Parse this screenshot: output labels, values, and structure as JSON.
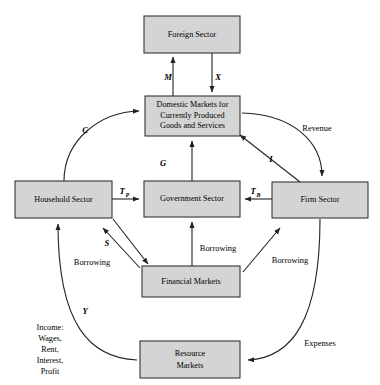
{
  "diagram": {
    "boxes": [
      {
        "id": "foreign",
        "label_lines": [
          "Foreign Sector"
        ],
        "x": 144,
        "y": 16,
        "w": 96,
        "h": 37
      },
      {
        "id": "domestic",
        "label_lines": [
          "Domestic Markets for",
          "Currently Produced",
          "Goods and Services"
        ],
        "x": 145,
        "y": 96,
        "w": 95,
        "h": 40
      },
      {
        "id": "household",
        "label_lines": [
          "Household Sector"
        ],
        "x": 15,
        "y": 181,
        "w": 97,
        "h": 37
      },
      {
        "id": "government",
        "label_lines": [
          "Government Sector"
        ],
        "x": 144,
        "y": 181,
        "w": 96,
        "h": 36
      },
      {
        "id": "firm",
        "label_lines": [
          "Firm Sector"
        ],
        "x": 272,
        "y": 182,
        "w": 96,
        "h": 36
      },
      {
        "id": "financial",
        "label_lines": [
          "Financial Markets"
        ],
        "x": 142,
        "y": 266,
        "w": 98,
        "h": 31
      },
      {
        "id": "resource",
        "label_lines": [
          "Resource",
          "Markets"
        ],
        "x": 140,
        "y": 341,
        "w": 100,
        "h": 37
      }
    ],
    "flow_labels": [
      {
        "id": "imports",
        "text": "M",
        "x": 168,
        "y": 77,
        "style": "symbol"
      },
      {
        "id": "exports",
        "text": "X",
        "x": 218,
        "y": 77,
        "style": "symbol"
      },
      {
        "id": "consumption",
        "text": "C",
        "x": 85,
        "y": 130,
        "style": "symbol"
      },
      {
        "id": "revenue",
        "text": "Revenue",
        "x": 317,
        "y": 128,
        "style": "plain"
      },
      {
        "id": "government-spending",
        "text": "G",
        "x": 163,
        "y": 163,
        "style": "symbol"
      },
      {
        "id": "investment",
        "text": "I",
        "x": 271,
        "y": 159,
        "style": "symbol"
      },
      {
        "id": "taxes-personal",
        "text": "T",
        "sub": "P",
        "x": 124,
        "y": 192,
        "style": "symbol-sub"
      },
      {
        "id": "taxes-business",
        "text": "T",
        "sub": "B",
        "x": 255,
        "y": 192,
        "style": "symbol-sub"
      },
      {
        "id": "savings",
        "text": "S",
        "x": 107,
        "y": 243,
        "style": "symbol"
      },
      {
        "id": "borrowing-household",
        "text": "Borrowing",
        "x": 92,
        "y": 262,
        "style": "plain"
      },
      {
        "id": "borrowing-government",
        "text": "Borrowing",
        "x": 218,
        "y": 248,
        "style": "plain"
      },
      {
        "id": "borrowing-firm",
        "text": "Borrowing",
        "x": 290,
        "y": 260,
        "style": "plain"
      },
      {
        "id": "income-symbol",
        "text": "Y",
        "x": 85,
        "y": 311,
        "style": "symbol"
      },
      {
        "id": "expenses",
        "text": "Expenses",
        "x": 320,
        "y": 343,
        "style": "plain"
      }
    ],
    "income_label": {
      "id": "income-breakdown",
      "lines": [
        "Income:",
        "Wages,",
        "Rent,",
        "Interest,",
        "Profit"
      ],
      "x": 50,
      "y": 330
    },
    "colors": {
      "box_fill": "#d4d4d4",
      "box_stroke": "#333333",
      "line": "#222222",
      "text": "#000000",
      "background": "#ffffff"
    }
  }
}
